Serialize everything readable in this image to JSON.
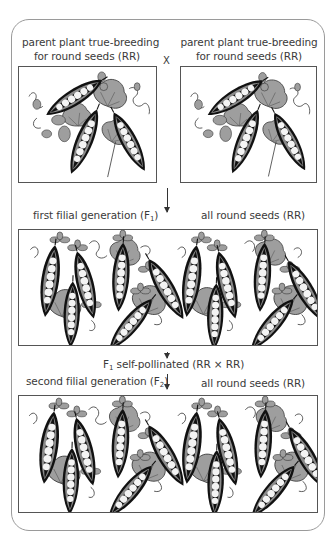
{
  "diagram": {
    "parents": {
      "left_label_line1": "parent plant true-breeding",
      "left_label_line2": "for round seeds (RR)",
      "right_label_line1": "parent plant true-breeding",
      "right_label_line2": "for round seeds (RR)",
      "cross_symbol": "X"
    },
    "f1": {
      "label_prefix": "first filial generation (F",
      "label_sub": "1",
      "label_suffix": ")",
      "result": "all round seeds (RR)"
    },
    "self_pollination": {
      "prefix": "F",
      "sub": "1",
      "suffix": " self-pollinated (RR × RR)"
    },
    "f2": {
      "label_prefix": "second filial generation (F",
      "label_sub": "2",
      "label_suffix": ")",
      "result": "all round seeds (RR)"
    },
    "colors": {
      "leaf": "#9e9e9e",
      "pod_outline": "#111111",
      "pod_fill": "#8a8a8a",
      "pea": "#f4f4f4",
      "border": "#9a9a9a"
    },
    "icons": {
      "down_arrow": "arrow-down-icon",
      "pea_pod": "pea-pod-icon",
      "leaf": "leaf-icon"
    }
  }
}
